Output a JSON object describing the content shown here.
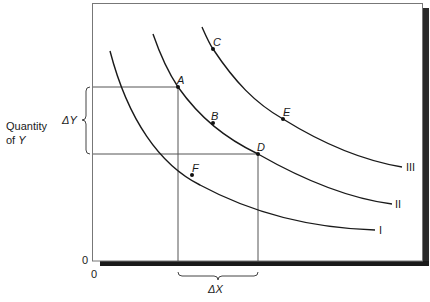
{
  "diagram": {
    "type": "indifference-curves",
    "y_axis_label_line1": "Quantity",
    "y_axis_label_line2_prefix": "of ",
    "y_axis_label_line2_var": "Y",
    "delta_y_label": "ΔY",
    "delta_x_label": "ΔX",
    "origin_y_label": "0",
    "origin_x_label": "0",
    "curves": [
      {
        "name": "I",
        "label": "I"
      },
      {
        "name": "II",
        "label": "II"
      },
      {
        "name": "III",
        "label": "III"
      }
    ],
    "points": [
      {
        "name": "A",
        "label": "A",
        "curve": "II"
      },
      {
        "name": "B",
        "label": "B",
        "curve": "II"
      },
      {
        "name": "C",
        "label": "C",
        "curve": "III"
      },
      {
        "name": "D",
        "label": "D",
        "curve": "II"
      },
      {
        "name": "E",
        "label": "E",
        "curve": "III"
      },
      {
        "name": "F",
        "label": "F",
        "curve": "I"
      }
    ]
  }
}
